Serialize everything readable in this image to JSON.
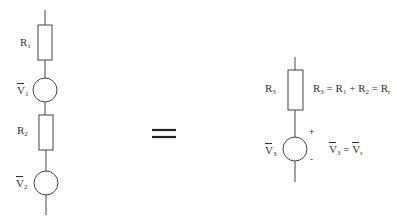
{
  "left_circuit": {
    "r1": {
      "base": "R",
      "sub": "1"
    },
    "v1": {
      "base": "V",
      "sub": "1"
    },
    "r2": {
      "base": "R",
      "sub": "2"
    },
    "v2": {
      "base": "V",
      "sub": "2"
    }
  },
  "equivalence_symbol": "=",
  "right_circuit": {
    "r3": {
      "base": "R",
      "sub": "3"
    },
    "v3": {
      "base": "V",
      "sub": "3"
    },
    "plus": "+",
    "minus": "-",
    "resistance_equation": {
      "lhs": {
        "base": "R",
        "sub": "3"
      },
      "eq1": "=",
      "t1": {
        "base": "R",
        "sub": "1"
      },
      "plus": "+",
      "t2": {
        "base": "R",
        "sub": "2"
      },
      "eq2": "=",
      "total": {
        "base": "R",
        "sub": "r"
      }
    },
    "voltage_equation": {
      "lhs": {
        "base": "V",
        "sub": "3"
      },
      "eq": "=",
      "rhs": {
        "base": "V",
        "sub": "r"
      }
    }
  },
  "colors": {
    "stroke": "#444444",
    "equals": "#222222"
  }
}
